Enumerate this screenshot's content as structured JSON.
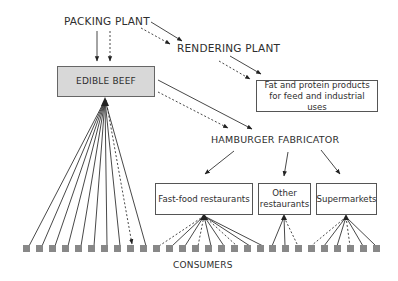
{
  "diagram": {
    "nodes": {
      "packing_plant": "PACKING PLANT",
      "rendering_plant": "RENDERING PLANT",
      "edible_beef": "EDIBLE BEEF",
      "fat_protein": "Fat and protein products for feed and industrial uses",
      "hamburger_fabricator": "HAMBURGER FABRICATOR",
      "fast_food": "Fast-food restaurants",
      "other_restaurants": "Other restaurants",
      "supermarkets": "Supermarkets",
      "consumers": "CONSUMERS"
    },
    "edges": [
      {
        "from": "packing_plant",
        "to": "edible_beef",
        "style": [
          "solid",
          "dashed"
        ]
      },
      {
        "from": "packing_plant",
        "to": "rendering_plant",
        "style": [
          "solid",
          "dashed"
        ]
      },
      {
        "from": "rendering_plant",
        "to": "fat_protein",
        "style": [
          "solid",
          "dashed"
        ]
      },
      {
        "from": "edible_beef",
        "to": "hamburger_fabricator",
        "style": [
          "solid",
          "dashed"
        ]
      },
      {
        "from": "hamburger_fabricator",
        "to": "fast_food",
        "style": [
          "solid"
        ]
      },
      {
        "from": "hamburger_fabricator",
        "to": "other_restaurants",
        "style": [
          "solid"
        ]
      },
      {
        "from": "hamburger_fabricator",
        "to": "supermarkets",
        "style": [
          "solid"
        ]
      },
      {
        "from": "edible_beef",
        "to": "consumers",
        "count": 10
      },
      {
        "from": "fast_food",
        "to": "consumers",
        "count": 9
      },
      {
        "from": "other_restaurants",
        "to": "consumers",
        "count": 3
      },
      {
        "from": "supermarkets",
        "to": "consumers",
        "count": 6
      }
    ],
    "consumer_count": 27,
    "colors": {
      "beef_box_fill": "#d8d8d8",
      "consumer_square": "#888888",
      "line": "#333333"
    }
  }
}
